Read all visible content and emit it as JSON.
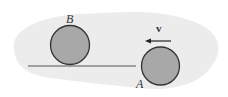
{
  "diagram": {
    "labels": {
      "ball_b": "B",
      "ball_a": "A",
      "velocity": "v"
    },
    "colors": {
      "background_blob": "#ececec",
      "ball_fill": "#a8a8a8",
      "ball_stroke": "#333333",
      "line": "#555555"
    }
  }
}
